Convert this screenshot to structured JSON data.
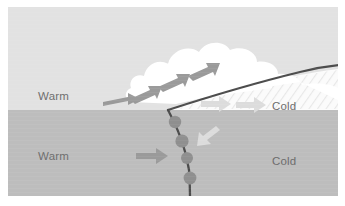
{
  "figure": {
    "panel": {
      "x": 8,
      "y": 7,
      "width": 330,
      "height": 189
    }
  },
  "colors": {
    "page_background": "#ffffff",
    "warm_air_upper": "#e2e2e2",
    "warm_air_lower": "#bdbdbd",
    "cold_air_wedge": "#fbfbfb",
    "cold_air_lower": "#bdbdbd",
    "cloud": "#ffffff",
    "front_line": "#4c4c4c",
    "front_bump": "#8f8f8f",
    "arrow_dark": "#9a9a9a",
    "arrow_light": "#dcdcdc",
    "label_text": "#6e6e6e",
    "hatching": "#ebebeb"
  },
  "labels": {
    "warm_upper": {
      "text": "Warm",
      "x": 38,
      "y": 100
    },
    "warm_lower": {
      "text": "Warm",
      "x": 38,
      "y": 160
    },
    "cold_upper": {
      "text": "Cold",
      "x": 272,
      "y": 110
    },
    "cold_lower": {
      "text": "Cold",
      "x": 272,
      "y": 165
    }
  },
  "features": {
    "ground_line_y": 110,
    "cloud_name": "cumulonimbus-cloud",
    "front_name": "cold-front-boundary",
    "front_symbol_count": 4,
    "hatching_name": "precipitation-hatching"
  },
  "arrows": {
    "warm_air_inflow": [
      {
        "name": "warm-inflow-arrow-low",
        "x": 103,
        "y": 99,
        "angle": -6,
        "length": 34,
        "color": "dark"
      },
      {
        "name": "warm-inflow-arrow-surface",
        "x": 138,
        "y": 156,
        "angle": 0,
        "length": 30,
        "color": "dark"
      }
    ],
    "updraft_arrows": [
      {
        "name": "updraft-arrow-1",
        "x": 141,
        "y": 92,
        "angle": -28,
        "length": 26,
        "color": "dark"
      },
      {
        "name": "updraft-arrow-2",
        "x": 168,
        "y": 80,
        "angle": -26,
        "length": 26,
        "color": "dark"
      },
      {
        "name": "updraft-arrow-3",
        "x": 196,
        "y": 69,
        "angle": -24,
        "length": 26,
        "color": "dark"
      }
    ],
    "cold_air_outflow": [
      {
        "name": "cold-outflow-arrow-1",
        "x": 208,
        "y": 104,
        "angle": 0,
        "length": 28,
        "color": "light"
      },
      {
        "name": "cold-outflow-arrow-2",
        "x": 243,
        "y": 105,
        "angle": 0,
        "length": 28,
        "color": "light"
      }
    ],
    "downdraft_arrows": [
      {
        "name": "downdraft-arrow",
        "x": 205,
        "y": 135,
        "angle": 215,
        "length": 22,
        "color": "light"
      }
    ]
  }
}
